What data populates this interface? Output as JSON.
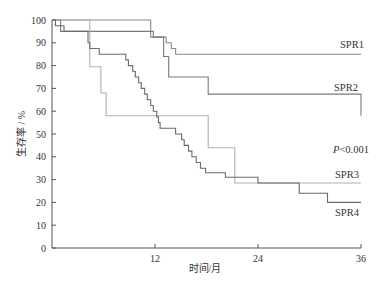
{
  "chart_data": {
    "type": "line",
    "subtype": "kaplan-meier-step",
    "title": "",
    "xlabel": "时间/月",
    "ylabel": "生存率 / %",
    "xlim": [
      0,
      36
    ],
    "ylim": [
      0,
      100
    ],
    "xticks": [
      12,
      24,
      36
    ],
    "yticks": [
      0,
      10,
      20,
      30,
      40,
      50,
      60,
      70,
      80,
      90,
      100
    ],
    "grid": false,
    "legend": "inline labels at right end of curves",
    "annotation": "P<0.001",
    "series": [
      {
        "name": "SPR1",
        "color": "#8a8a8a",
        "points": [
          [
            0,
            100
          ],
          [
            11.5,
            100
          ],
          [
            11.5,
            92.5
          ],
          [
            13.3,
            92.5
          ],
          [
            13.3,
            90
          ],
          [
            13.9,
            90
          ],
          [
            13.9,
            87.5
          ],
          [
            14.4,
            87.5
          ],
          [
            14.4,
            85
          ],
          [
            36,
            85
          ]
        ]
      },
      {
        "name": "SPR2",
        "color": "#7a7a7a",
        "points": [
          [
            0,
            100
          ],
          [
            1.0,
            100
          ],
          [
            1.0,
            95
          ],
          [
            11.8,
            95
          ],
          [
            11.8,
            92.5
          ],
          [
            13.0,
            92.5
          ],
          [
            13.0,
            84
          ],
          [
            13.6,
            84
          ],
          [
            13.6,
            75
          ],
          [
            18.2,
            75
          ],
          [
            18.2,
            67.5
          ],
          [
            36,
            67.5
          ],
          [
            36,
            58
          ]
        ]
      },
      {
        "name": "SPR3",
        "color": "#b0b0b0",
        "points": [
          [
            0,
            100
          ],
          [
            4.4,
            100
          ],
          [
            4.4,
            79.5
          ],
          [
            5.7,
            79.5
          ],
          [
            5.7,
            68
          ],
          [
            6.3,
            68
          ],
          [
            6.3,
            58
          ],
          [
            18.2,
            58
          ],
          [
            18.2,
            44
          ],
          [
            21.3,
            44
          ],
          [
            21.3,
            28.5
          ],
          [
            36,
            28.5
          ]
        ]
      },
      {
        "name": "SPR4",
        "color": "#6a6a6a",
        "points": [
          [
            0,
            100
          ],
          [
            0.4,
            100
          ],
          [
            0.4,
            97.5
          ],
          [
            1.4,
            97.5
          ],
          [
            1.4,
            95
          ],
          [
            4.2,
            95
          ],
          [
            4.2,
            90
          ],
          [
            4.4,
            90
          ],
          [
            4.4,
            87.5
          ],
          [
            5.5,
            87.5
          ],
          [
            5.5,
            85
          ],
          [
            8.6,
            85
          ],
          [
            8.6,
            82.5
          ],
          [
            8.9,
            82.5
          ],
          [
            8.9,
            80
          ],
          [
            9.4,
            80
          ],
          [
            9.4,
            77.5
          ],
          [
            9.7,
            77.5
          ],
          [
            9.7,
            75
          ],
          [
            10.1,
            75
          ],
          [
            10.1,
            72.5
          ],
          [
            10.4,
            72.5
          ],
          [
            10.4,
            70
          ],
          [
            10.8,
            70
          ],
          [
            10.8,
            67.5
          ],
          [
            11.1,
            67.5
          ],
          [
            11.1,
            65
          ],
          [
            11.5,
            65
          ],
          [
            11.5,
            62.5
          ],
          [
            11.8,
            62.5
          ],
          [
            11.8,
            60
          ],
          [
            12.2,
            60
          ],
          [
            12.2,
            57.5
          ],
          [
            12.4,
            57.5
          ],
          [
            12.4,
            55
          ],
          [
            12.6,
            55
          ],
          [
            12.6,
            52.5
          ],
          [
            14.4,
            52.5
          ],
          [
            14.4,
            50
          ],
          [
            15.1,
            50
          ],
          [
            15.1,
            47.5
          ],
          [
            15.4,
            47.5
          ],
          [
            15.4,
            45
          ],
          [
            15.9,
            45
          ],
          [
            15.9,
            42.5
          ],
          [
            16.3,
            42.5
          ],
          [
            16.3,
            40
          ],
          [
            16.8,
            40
          ],
          [
            16.8,
            37.5
          ],
          [
            17.3,
            37.5
          ],
          [
            17.3,
            35
          ],
          [
            17.9,
            35
          ],
          [
            17.9,
            33
          ],
          [
            20.2,
            33
          ],
          [
            20.2,
            31
          ],
          [
            24.0,
            31
          ],
          [
            24.0,
            28.5
          ],
          [
            28.8,
            28.5
          ],
          [
            28.8,
            24
          ],
          [
            32.1,
            24
          ],
          [
            32.1,
            20
          ],
          [
            36,
            20
          ]
        ]
      }
    ]
  },
  "labels": {
    "spr1": "SPR1",
    "spr2": "SPR2",
    "spr3": "SPR3",
    "spr4": "SPR4",
    "p_value_italic": "P",
    "p_value_rest": "<0.001",
    "xlabel": "时间/月",
    "ylabel": "生存率 / %"
  }
}
